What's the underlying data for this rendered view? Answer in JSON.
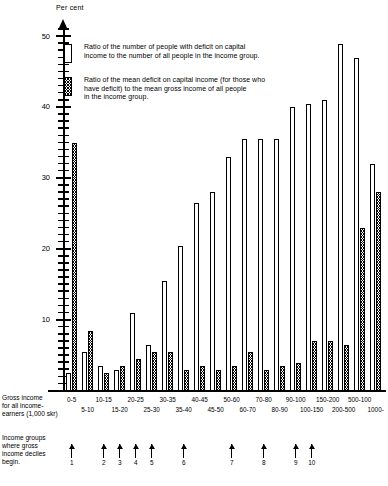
{
  "axis": {
    "y_title": "Per cent",
    "y_ticks": [
      "10",
      "20",
      "30",
      "40",
      "50"
    ]
  },
  "legend": {
    "items": [
      {
        "swatch": "white-bar-swatch",
        "text": "Ratio of the number of people with deficit on capital\nincome to the number of all people in the income group."
      },
      {
        "swatch": "hatched-bar-swatch",
        "text": "Ratio of the mean deficit on capital income (for those who\nhave deficit) to the mean gross income of all people\nin the income group."
      }
    ]
  },
  "captions": {
    "x_axis": "Gross income\nfor all income-\nearners (1,000 skr)",
    "deciles": "Income groups\nwhere gross\nincome deciles\nbegin."
  },
  "deciles": {
    "labels": [
      "1",
      "2",
      "3",
      "4",
      "5",
      "6",
      "7",
      "8",
      "9",
      "10"
    ],
    "group_index": [
      0,
      2,
      3,
      4,
      5,
      7,
      10,
      12,
      14,
      15
    ]
  },
  "chart_data": {
    "type": "bar",
    "title": "",
    "xlabel": "Gross income for all income-earners (1,000 skr)",
    "ylabel": "Per cent",
    "ylim": [
      0,
      52
    ],
    "grid": false,
    "legend_position": "top-left",
    "categories": [
      "0-5",
      "5-10",
      "10-15",
      "15-20",
      "20-25",
      "25-30",
      "30-35",
      "35-40",
      "40-45",
      "45-50",
      "50-60",
      "60-70",
      "70-80",
      "80-90",
      "90-100",
      "100-150",
      "150-200",
      "200-500",
      "500-100",
      "1000-"
    ],
    "series": [
      {
        "name": "Ratio of the number of people with deficit on capital income to the number of all people in the income group.",
        "style": "white",
        "values": [
          2.5,
          5.5,
          3.5,
          3.0,
          11.0,
          6.5,
          15.5,
          20.5,
          26.5,
          28.0,
          33.0,
          35.5,
          35.5,
          35.5,
          40.0,
          40.5,
          41.0,
          49.0,
          47.0,
          32.0
        ]
      },
      {
        "name": "Ratio of the mean deficit on capital income (for those who have deficit) to the mean gross income of all people in the income group.",
        "style": "hatched",
        "values": [
          35.0,
          8.5,
          2.5,
          3.5,
          4.5,
          5.5,
          5.5,
          3.0,
          3.5,
          3.0,
          3.5,
          5.5,
          3.0,
          3.5,
          4.0,
          7.0,
          7.0,
          6.5,
          23.0,
          28.0
        ]
      }
    ]
  }
}
